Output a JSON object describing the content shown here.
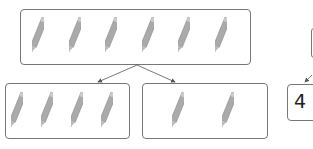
{
  "diagram": {
    "whole": {
      "count": 6,
      "item": "pencil-icon"
    },
    "parts": [
      {
        "count": 4,
        "item": "pencil-icon"
      },
      {
        "count": 2,
        "item": "pencil-icon"
      }
    ],
    "number_bond_partial": {
      "value": "4"
    }
  },
  "colors": {
    "border": "#777777",
    "pencil": "#9a9a9a",
    "arrow": "#555555"
  }
}
